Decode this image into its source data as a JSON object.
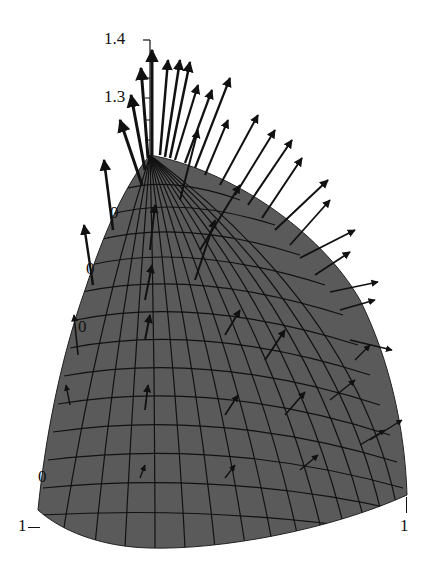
{
  "figure": {
    "surface_fill": "#5a5a5a",
    "grid_color": "#111111",
    "arrow_color": "#111111"
  },
  "axes": {
    "vertical_ticks": [
      "1.4",
      "1.3"
    ],
    "left_partial_ticks": [
      "0",
      "0",
      "0"
    ],
    "bottom_left_ticks": [
      "0",
      "1"
    ],
    "bottom_right_tick": "1"
  }
}
